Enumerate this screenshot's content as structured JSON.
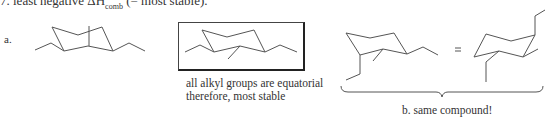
{
  "header": {
    "prefix": "7. least negative ΔH",
    "subscript": "comb",
    "suffix": " (= most stable)."
  },
  "part_a": {
    "label": "a.",
    "molecules": [
      {
        "name": "trialkyl-cyclohexane-chair-1",
        "description": "chair with two ethyl groups equatorial and one methyl axial"
      },
      {
        "name": "trialkyl-cyclohexane-chair-2-boxed",
        "description": "chair with all alkyl groups equatorial",
        "boxed": true
      }
    ],
    "caption_line1": "all alkyl groups are equatorial",
    "caption_line2": "therefore, most stable"
  },
  "part_b": {
    "equals_sign": "=",
    "molecules": [
      {
        "name": "chair-conformer-left"
      },
      {
        "name": "chair-conformer-right"
      }
    ],
    "caption": "b. same compound!"
  }
}
